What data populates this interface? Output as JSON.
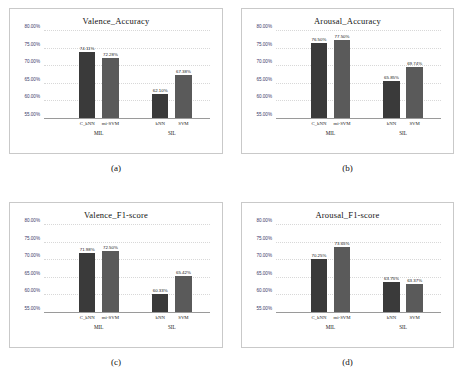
{
  "figure": {
    "panels": [
      {
        "caption": "(a)",
        "chart_data": {
          "type": "bar",
          "title": "Valence_Accuracy",
          "xlabel": "",
          "ylabel": "",
          "ylim": [
            55,
            80
          ],
          "yticks": [
            "55.00%",
            "60.00%",
            "65.00%",
            "70.00%",
            "75.00%",
            "80.00%"
          ],
          "ytick_values": [
            55,
            60,
            65,
            70,
            75,
            80
          ],
          "grid": true,
          "legend": "none",
          "groups": [
            {
              "name": "MIL",
              "categories": [
                "C_kNN",
                "mi-SVM"
              ],
              "values": [
                74.11,
                72.28
              ],
              "labels": [
                "74.11%",
                "72.28%"
              ]
            },
            {
              "name": "SIL",
              "categories": [
                "kNN",
                "SVM"
              ],
              "values": [
                62.1,
                67.38
              ],
              "labels": [
                "62.10%",
                "67.38%"
              ]
            }
          ]
        }
      },
      {
        "caption": "(b)",
        "chart_data": {
          "type": "bar",
          "title": "Arousal_Accuracy",
          "xlabel": "",
          "ylabel": "",
          "ylim": [
            55,
            80
          ],
          "yticks": [
            "55.00%",
            "60.00%",
            "65.00%",
            "70.00%",
            "75.00%",
            "80.00%"
          ],
          "ytick_values": [
            55,
            60,
            65,
            70,
            75,
            80
          ],
          "grid": true,
          "legend": "none",
          "groups": [
            {
              "name": "MIL",
              "categories": [
                "C_kNN",
                "mi-SVM"
              ],
              "values": [
                76.5,
                77.5
              ],
              "labels": [
                "76.50%",
                "77.50%"
              ]
            },
            {
              "name": "SIL",
              "categories": [
                "kNN",
                "SVM"
              ],
              "values": [
                65.85,
                69.74
              ],
              "labels": [
                "65.85%",
                "69.74%"
              ]
            }
          ]
        }
      },
      {
        "caption": "(c)",
        "chart_data": {
          "type": "bar",
          "title": "Valence_F1-score",
          "xlabel": "",
          "ylabel": "",
          "ylim": [
            55,
            80
          ],
          "yticks": [
            "55.00%",
            "60.00%",
            "65.00%",
            "70.00%",
            "75.00%",
            "80.00%"
          ],
          "ytick_values": [
            55,
            60,
            65,
            70,
            75,
            80
          ],
          "grid": true,
          "legend": "none",
          "groups": [
            {
              "name": "MIL",
              "categories": [
                "C_kNN",
                "mi-SVM"
              ],
              "values": [
                71.98,
                72.5
              ],
              "labels": [
                "71.98%",
                "72.50%"
              ]
            },
            {
              "name": "SIL",
              "categories": [
                "kNN",
                "SVM"
              ],
              "values": [
                60.33,
                65.42
              ],
              "labels": [
                "60.33%",
                "65.42%"
              ]
            }
          ]
        }
      },
      {
        "caption": "(d)",
        "chart_data": {
          "type": "bar",
          "title": "Arousal_F1-score",
          "xlabel": "",
          "ylabel": "",
          "ylim": [
            55,
            80
          ],
          "yticks": [
            "55.00%",
            "60.00%",
            "65.00%",
            "70.00%",
            "75.00%",
            "80.00%"
          ],
          "ytick_values": [
            55,
            60,
            65,
            70,
            75,
            80
          ],
          "grid": true,
          "legend": "none",
          "groups": [
            {
              "name": "MIL",
              "categories": [
                "C_kNN",
                "mi-SVM"
              ],
              "values": [
                70.25,
                73.65
              ],
              "labels": [
                "70.25%",
                "73.65%"
              ]
            },
            {
              "name": "SIL",
              "categories": [
                "kNN",
                "SVM"
              ],
              "values": [
                63.75,
                63.37
              ],
              "labels": [
                "63.75%",
                "63.37%"
              ]
            }
          ]
        }
      }
    ],
    "colors": {
      "bar_first": "#3a3a3a",
      "bar_second": "#5a5a5a",
      "panel_border": "#c9c9c9",
      "gridline": "#d8d8d8",
      "tick_text": "#3b3b6b",
      "background": "#ffffff"
    }
  }
}
